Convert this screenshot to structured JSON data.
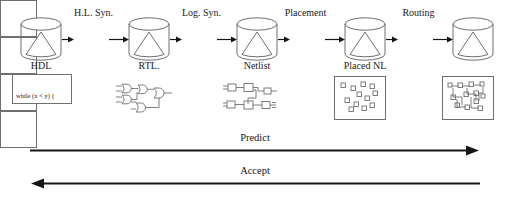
{
  "figure": {
    "background_color": "#ffffff",
    "line_color": "#6f6f6f",
    "arrow_color": "#161616",
    "text_color": "#1a1a1a"
  },
  "stages": [
    {
      "id": "hl-syn",
      "label": "H.L. Syn.",
      "x": 72,
      "y": 22,
      "w": 37,
      "h": 37,
      "label_x": 62,
      "label_y": 7
    },
    {
      "id": "log-syn",
      "label": "Log. Syn.",
      "x": 180,
      "y": 22,
      "w": 37,
      "h": 37,
      "label_x": 170,
      "label_y": 7
    },
    {
      "id": "placement",
      "label": "Placement",
      "x": 288,
      "y": 22,
      "w": 37,
      "h": 37,
      "label_x": 274,
      "label_y": 7
    },
    {
      "id": "routing",
      "label": "Routing",
      "x": 396,
      "y": 22,
      "w": 37,
      "h": 37,
      "label_x": 387,
      "label_y": 7
    }
  ],
  "data_nodes": [
    {
      "id": "hdl",
      "label": "HDL",
      "x": 20,
      "y": 17,
      "w": 42,
      "h": 44,
      "label_x": 14,
      "label_y": 60,
      "label_w": 54
    },
    {
      "id": "rtl",
      "label": "RTL.",
      "x": 128,
      "y": 17,
      "w": 42,
      "h": 44,
      "label_x": 122,
      "label_y": 60,
      "label_w": 54
    },
    {
      "id": "netlist",
      "label": "Netlist",
      "x": 236,
      "y": 17,
      "w": 42,
      "h": 44,
      "label_x": 230,
      "label_y": 60,
      "label_w": 54
    },
    {
      "id": "placed-nl",
      "label": "Placed NL",
      "x": 344,
      "y": 17,
      "w": 42,
      "h": 44,
      "label_x": 332,
      "label_y": 60,
      "label_w": 66
    },
    {
      "id": "routed",
      "label": "",
      "x": 452,
      "y": 17,
      "w": 42,
      "h": 44,
      "label_x": 446,
      "label_y": 60,
      "label_w": 54
    }
  ],
  "connectors": [
    {
      "id": "hdl-to-hlsyn",
      "x": 62,
      "y": 35,
      "length": 12
    },
    {
      "id": "hlsyn-to-rtl",
      "x": 109,
      "y": 35,
      "length": 20
    },
    {
      "id": "rtl-to-logsyn",
      "x": 170,
      "y": 35,
      "length": 12
    },
    {
      "id": "logsyn-to-netlist",
      "x": 217,
      "y": 35,
      "length": 20
    },
    {
      "id": "netlist-to-placement",
      "x": 278,
      "y": 35,
      "length": 12
    },
    {
      "id": "placement-to-placed",
      "x": 325,
      "y": 35,
      "length": 20
    },
    {
      "id": "placed-to-routing",
      "x": 386,
      "y": 35,
      "length": 12
    },
    {
      "id": "routing-to-routed",
      "x": 433,
      "y": 35,
      "length": 20
    }
  ],
  "artifacts": {
    "hdl_code": {
      "id": "hdl-source-code",
      "x": 12,
      "y": 74,
      "w": 60,
      "h": 30,
      "lines": [
        "while (x < y) {",
        "    x + = dt;",
        "}"
      ]
    },
    "rtl_gates": {
      "id": "rtl-gate-netlist-sketch",
      "x": 114,
      "y": 82,
      "w": 72,
      "h": 32
    },
    "gate_netlist": {
      "id": "netlist-cell-sketch",
      "x": 222,
      "y": 82,
      "w": 72,
      "h": 32
    },
    "placed_layout": {
      "id": "placed-netlist-layout",
      "x": 334,
      "y": 76,
      "w": 52,
      "h": 44
    },
    "routed_layout": {
      "id": "routed-netlist-layout",
      "x": 442,
      "y": 76,
      "w": 52,
      "h": 44
    }
  },
  "flows": [
    {
      "id": "predict",
      "label": "Predict",
      "direction": "right",
      "x": 30,
      "y": 150,
      "length": 450,
      "label_x": 215,
      "label_y": 132,
      "label_w": 80
    },
    {
      "id": "accept",
      "label": "Accept",
      "direction": "left",
      "x": 30,
      "y": 183,
      "length": 450,
      "label_x": 215,
      "label_y": 165,
      "label_w": 80
    }
  ]
}
